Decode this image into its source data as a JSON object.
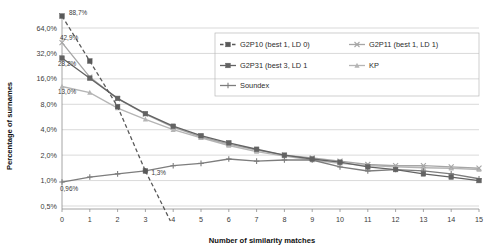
{
  "chart_data": {
    "type": "line",
    "title": "",
    "xlabel": "Number of similarity matches",
    "ylabel": "Percentage of surnames",
    "x": [
      0,
      1,
      2,
      3,
      4,
      5,
      6,
      7,
      8,
      9,
      10,
      11,
      12,
      13,
      14,
      15
    ],
    "xtick_labels": [
      "0",
      "1",
      "2",
      "3",
      "4",
      "5",
      "6",
      "7",
      "8",
      "9",
      "10",
      "11",
      "12",
      "13",
      "14",
      "15"
    ],
    "ytick_labels": [
      "64,0%",
      "32,0%",
      "16,0%",
      "8,0%",
      "4,0%",
      "2,0%",
      "1,0%",
      "0,5%"
    ],
    "ytick_values": [
      64.0,
      32.0,
      16.0,
      8.0,
      4.0,
      2.0,
      1.0,
      0.5
    ],
    "yscale": "log",
    "ylim": [
      0.4,
      100.0
    ],
    "grid": "horizontal",
    "legend_position": "inside-right",
    "series": [
      {
        "name": "G2P10 (best 1, LD 0)",
        "style": "dashed",
        "marker": "square",
        "color": "#595959",
        "values": [
          88.7,
          26.0,
          7.5,
          1.3,
          null,
          null,
          null,
          null,
          null,
          null,
          null,
          null,
          null,
          null,
          null,
          null
        ]
      },
      {
        "name": "G2P11 (best 1, LD 1)",
        "style": "solid",
        "marker": "x",
        "color": "#a6a6a6",
        "values": [
          42.9,
          16.8,
          9.3,
          6.1,
          4.3,
          3.3,
          2.7,
          2.3,
          2.0,
          1.85,
          1.7,
          1.55,
          1.5,
          1.5,
          1.45,
          1.4
        ]
      },
      {
        "name": "G2P31 (best 3, LD 1",
        "style": "solid",
        "marker": "square",
        "color": "#636363",
        "values": [
          28.2,
          16.3,
          9.4,
          6.2,
          4.4,
          3.4,
          2.8,
          2.35,
          2.0,
          1.8,
          1.65,
          1.45,
          1.35,
          1.2,
          1.1,
          1.0
        ]
      },
      {
        "name": "KP",
        "style": "solid",
        "marker": "triangle",
        "color": "#b5b5b5",
        "values": [
          13.0,
          11.0,
          7.2,
          5.3,
          4.0,
          3.2,
          2.6,
          2.2,
          1.95,
          1.75,
          1.6,
          1.5,
          1.45,
          1.42,
          1.4,
          1.35
        ]
      },
      {
        "name": "Soundex",
        "style": "solid",
        "marker": "plus",
        "color": "#7d7d7d",
        "values": [
          0.96,
          1.1,
          1.2,
          1.3,
          1.5,
          1.6,
          1.8,
          1.7,
          1.75,
          1.75,
          1.45,
          1.3,
          1.35,
          1.3,
          1.2,
          1.05
        ]
      }
    ],
    "annotations": [
      {
        "text": "88,7%",
        "x": 0,
        "y": 88.7
      },
      {
        "text": "42,9%",
        "x": 0,
        "y": 42.9
      },
      {
        "text": "28,2%",
        "x": 0,
        "y": 28.2
      },
      {
        "text": "13,0%",
        "x": 0,
        "y": 13.0
      },
      {
        "text": "0,96%",
        "x": 0,
        "y": 0.96
      },
      {
        "text": "1,3%",
        "x": 3,
        "y": 1.3
      }
    ]
  },
  "legend": {
    "entries": [
      {
        "label": "G2P10 (best 1, LD 0)"
      },
      {
        "label": "G2P11 (best 1, LD 1)"
      },
      {
        "label": "G2P31 (best 3, LD 1"
      },
      {
        "label": "KP"
      },
      {
        "label": "Soundex"
      }
    ]
  }
}
